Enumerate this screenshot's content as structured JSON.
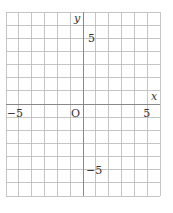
{
  "chart_data": {
    "type": "scatter",
    "title": "",
    "xlabel": "x",
    "ylabel": "y",
    "xlim": [
      -6,
      6
    ],
    "ylim": [
      -7,
      7
    ],
    "grid": true,
    "grid_step": 1,
    "origin_label": "O",
    "x_tick_labels": [
      {
        "value": -5,
        "label": "−5"
      },
      {
        "value": 5,
        "label": "5"
      }
    ],
    "y_tick_labels": [
      {
        "value": 5,
        "label": "5"
      },
      {
        "value": -5,
        "label": "−5"
      }
    ],
    "series": []
  },
  "colors": {
    "grid": "#b8b8b8",
    "axis": "#888888",
    "text": "#333333"
  }
}
